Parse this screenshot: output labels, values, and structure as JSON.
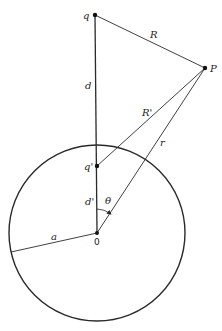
{
  "figure": {
    "colors": {
      "stroke": "#2a2a2a",
      "background": "#ffffff"
    },
    "points": {
      "q": {
        "label": "q",
        "x": 95,
        "y": 15
      },
      "P": {
        "label": "P",
        "x": 205,
        "y": 68
      },
      "q_image": {
        "label": "q'",
        "x": 97,
        "y": 166
      },
      "O": {
        "label": "0",
        "x": 97,
        "y": 233
      }
    },
    "sphere": {
      "cx": 97,
      "cy": 233,
      "r": 88,
      "radius_label": "a"
    },
    "segments": {
      "R": {
        "label": "R",
        "from": "q",
        "to": "P"
      },
      "d": {
        "label": "d",
        "from": "q",
        "to": "O"
      },
      "R_prime": {
        "label": "R'",
        "from": "q_image",
        "to": "P"
      },
      "r": {
        "label": "r",
        "from": "O",
        "to": "P"
      },
      "d_prime": {
        "label": "d'",
        "from": "q_image",
        "to": "O"
      },
      "a": {
        "label": "a",
        "from": "O",
        "to": "sphere-left-edge"
      }
    },
    "angle": {
      "label": "θ",
      "between": [
        "d",
        "r"
      ]
    }
  }
}
